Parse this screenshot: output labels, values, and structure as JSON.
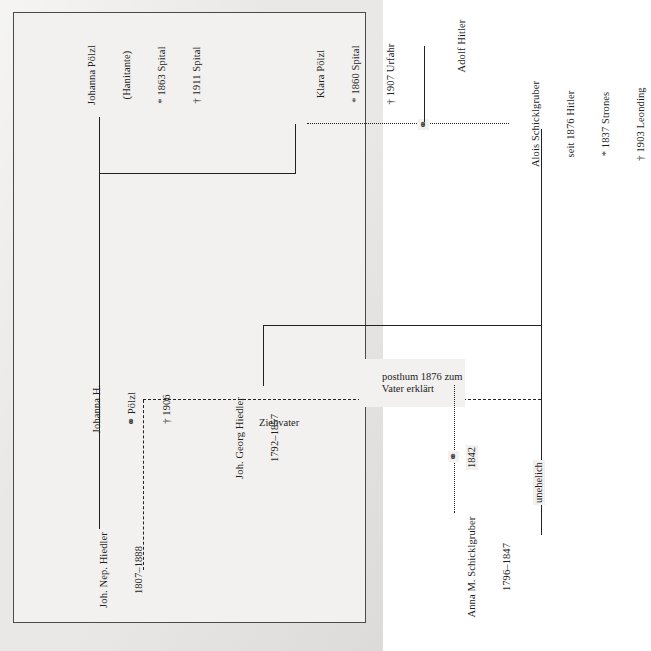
{
  "figure": {
    "type": "genealogy-chart",
    "language": "de",
    "orientation": "rotated-90-ccw",
    "frame_color": "#4a4a4a",
    "line_color": "#222222",
    "page_color": "#e9e8e6"
  },
  "people": {
    "joh_nep_hiedler": {
      "name": "Joh. Nep. Hiedler",
      "dates": "1807–1888"
    },
    "johanna_h": {
      "name": "Johanna H.",
      "marriage": "⚭ Pölzl",
      "death": "† 1906"
    },
    "johanna_poelzl": {
      "name": "Johanna Pölzl",
      "nickname": "(Hanitante)",
      "birth": "* 1863 Spital",
      "death": "† 1911 Spital"
    },
    "joh_georg_hiedler": {
      "name": "Joh. Georg Hiedler",
      "dates": "1792–1857"
    },
    "anna_schicklgruber": {
      "name": "Anna M. Schicklgruber",
      "dates": "1796–1847"
    },
    "alois_schicklgruber": {
      "name": "Alois Schicklgruber",
      "renamed": "seit 1876 Hitler",
      "birth": "* 1837 Strones",
      "death": "† 1903 Leonding"
    },
    "klara_poelzl": {
      "name": "Klara Pölzl",
      "birth": "* 1860 Spital",
      "death": "† 1907 Urfahr"
    },
    "adolf_hitler": {
      "name": "Adolf Hitler"
    }
  },
  "annotations": {
    "marriage_symbol": "⚭",
    "marriage_year_1842": "1842",
    "unehelich": "unehelich",
    "posthum_line1": "posthum 1876 zum",
    "posthum_line2": "Vater erklärt",
    "ziehvater": "Ziehvater"
  }
}
